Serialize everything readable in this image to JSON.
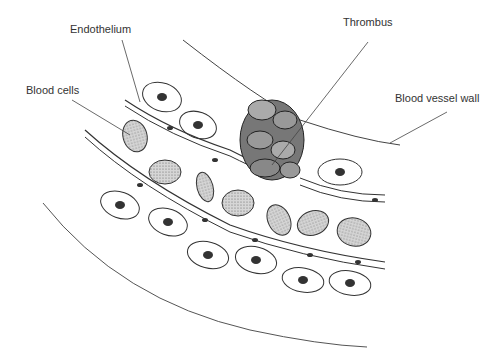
{
  "diagram": {
    "labels": {
      "endothelium": "Endothelium",
      "thrombus": "Thrombus",
      "blood_cells": "Blood cells",
      "vessel_wall": "Blood vessel wall"
    },
    "colors": {
      "line": "#333333",
      "rbc_fill": "#c8c8c8",
      "thrombus_fill": "#555555",
      "background": "#ffffff"
    }
  }
}
